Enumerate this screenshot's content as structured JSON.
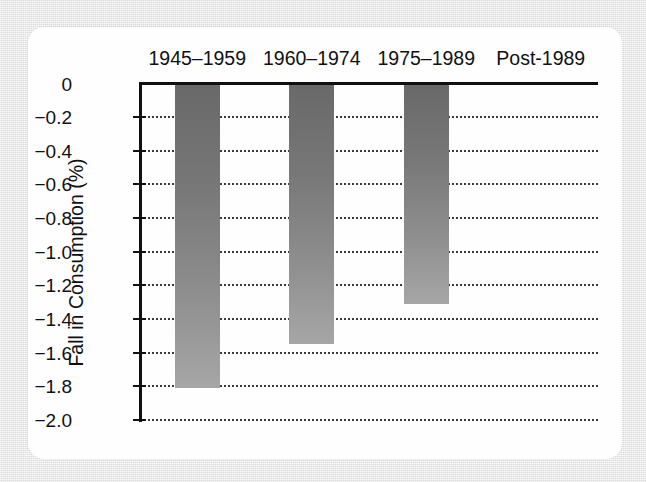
{
  "figure": {
    "background_color": "#eaeae9",
    "card_color": "#fefefe"
  },
  "chart_data": {
    "type": "bar",
    "title": "",
    "subtitle": "",
    "xlabel": "",
    "ylabel": "Fall in Consumption (%)",
    "categories": [
      "1945–1959",
      "1960–1974",
      "1975–1989",
      "Post-1989"
    ],
    "values": [
      -1.81,
      -1.55,
      -1.31,
      0
    ],
    "ylim": [
      -2.0,
      0
    ],
    "ytick_labels": [
      "0",
      "−0.2",
      "−0.4",
      "−0.6",
      "−0.8",
      "−1.0",
      "−1.2",
      "−1.4",
      "−1.6",
      "−1.8",
      "−2.0"
    ],
    "ytick_values": [
      0,
      -0.2,
      -0.4,
      -0.6,
      -0.8,
      -1.0,
      -1.2,
      -1.4,
      -1.6,
      -1.8,
      -2.0
    ],
    "grid": "horizontal-dotted",
    "legend": "none",
    "x_axis_position": "top",
    "bar_fill": {
      "style": "vertical-gradient",
      "top_color": "#696969",
      "bottom_color": "#a6a6a6"
    },
    "axis_color": "#111111",
    "grid_color": "#3a3a3a"
  }
}
